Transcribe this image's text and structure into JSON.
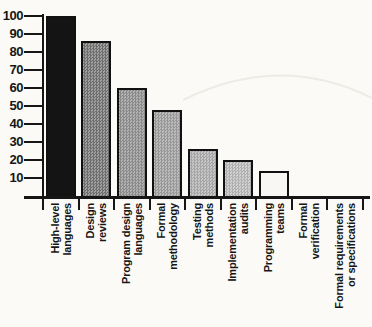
{
  "chart_data": {
    "type": "bar",
    "title": "",
    "xlabel": "",
    "ylabel": "",
    "ylim": [
      0,
      100
    ],
    "yticks": [
      10,
      20,
      30,
      40,
      50,
      60,
      70,
      80,
      90,
      100
    ],
    "grid": false,
    "legend": null,
    "categories": [
      "High-level languages",
      "Design reviews",
      "Program design languages",
      "Formal methodology",
      "Testing methods",
      "Implementation audits",
      "Programming teams",
      "Formal verification",
      "Formal requirements or specifications"
    ],
    "values": [
      100,
      86,
      60,
      48,
      26,
      20,
      14,
      0,
      0
    ],
    "bars": [
      {
        "label_lines": [
          "High-level",
          "languages"
        ],
        "value": 100,
        "fill_a": "#141414",
        "fill_b": "#141414",
        "border": "#111111"
      },
      {
        "label_lines": [
          "Design",
          "reviews"
        ],
        "value": 86,
        "fill_a": "#6e6e6e",
        "fill_b": "#a0a0a0",
        "border": "#111111"
      },
      {
        "label_lines": [
          "Program design",
          "languages"
        ],
        "value": 60,
        "fill_a": "#8a8a8a",
        "fill_b": "#b2b2b2",
        "border": "#111111"
      },
      {
        "label_lines": [
          "Formal",
          "methodology"
        ],
        "value": 48,
        "fill_a": "#979797",
        "fill_b": "#bdbdbd",
        "border": "#111111"
      },
      {
        "label_lines": [
          "Testing",
          "methods"
        ],
        "value": 26,
        "fill_a": "#a5a5a5",
        "fill_b": "#c8c8c8",
        "border": "#111111"
      },
      {
        "label_lines": [
          "Implementation",
          "audits"
        ],
        "value": 20,
        "fill_a": "#afafaf",
        "fill_b": "#d2d2d2",
        "border": "#111111"
      },
      {
        "label_lines": [
          "Programming",
          "teams"
        ],
        "value": 14,
        "fill_a": "#f8f7f4",
        "fill_b": "#f8f7f4",
        "border": "#111111"
      },
      {
        "label_lines": [
          "Formal",
          "verification"
        ],
        "value": 0,
        "fill_a": "#f8f7f4",
        "fill_b": "#f8f7f4",
        "border": "#111111"
      },
      {
        "label_lines": [
          "Formal requirements",
          "or specifications"
        ],
        "value": 0,
        "fill_a": "#f8f7f4",
        "fill_b": "#f8f7f4",
        "border": "#111111"
      }
    ],
    "axis_color": "#161616"
  },
  "colors": {
    "background": "#fbfaf7",
    "axis": "#161616",
    "text": "#161616"
  }
}
